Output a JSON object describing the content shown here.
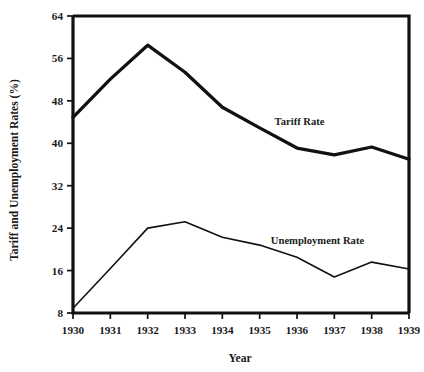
{
  "chart_data": {
    "type": "line",
    "title": "",
    "xlabel": "Year",
    "ylabel": "Tariff and Unemployment Rates (%)",
    "categories": [
      "1930",
      "1931",
      "1932",
      "1933",
      "1934",
      "1935",
      "1936",
      "1937",
      "1938",
      "1939"
    ],
    "x": [
      1930,
      1931,
      1932,
      1933,
      1934,
      1935,
      1936,
      1937,
      1938,
      1939
    ],
    "xlim": [
      1930,
      1939
    ],
    "ylim": [
      8,
      64
    ],
    "yticks": [
      8,
      16,
      24,
      32,
      40,
      48,
      56,
      64
    ],
    "ytick_labels": [
      "8",
      "16",
      "24",
      "32",
      "40",
      "48",
      "56",
      "64"
    ],
    "xtick_labels": [
      "1930",
      "1931",
      "1932",
      "1933",
      "1934",
      "1935",
      "1936",
      "1937",
      "1938",
      "1939"
    ],
    "grid": false,
    "legend_position": "inline-annotation",
    "series": [
      {
        "name": "Tariff Rate",
        "label": "Tariff Rate",
        "style": "thick",
        "color": "#111111",
        "values": [
          44.9,
          52.1,
          58.5,
          53.4,
          46.8,
          42.9,
          39.1,
          37.8,
          39.3,
          37.0
        ]
      },
      {
        "name": "Unemployment Rate",
        "label": "Unemployment Rate",
        "style": "thin",
        "color": "#111111",
        "values": [
          8.9,
          16.4,
          24.0,
          25.2,
          22.3,
          20.8,
          18.5,
          14.8,
          17.6,
          16.3
        ]
      }
    ],
    "annotations": [
      {
        "text": "Tariff Rate",
        "x": 1935.4,
        "y": 43.5
      },
      {
        "text": "Unemployment Rate",
        "x": 1935.3,
        "y": 21.0
      }
    ]
  },
  "axes": {
    "x_title": "Year",
    "y_title": "Tariff and Unemployment Rates (%)"
  }
}
